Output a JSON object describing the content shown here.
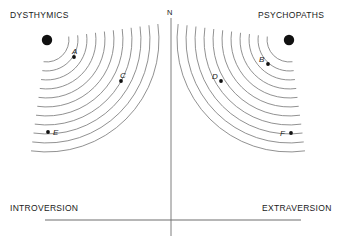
{
  "figure": {
    "title_n_axis": "N",
    "quadrants": {
      "top_left": "DYSTHYMICS",
      "top_right": "PSYCHOPATHS"
    },
    "axes": {
      "left": "INTROVERSION",
      "right": "EXTRAVERSION",
      "vertical": "N"
    },
    "colors": {
      "ink": "#1a1a1a",
      "arc": "#7d7d7d",
      "axis": "#6f6f6f",
      "point": "#111111"
    }
  },
  "chart_data": {
    "type": "scatter",
    "title": "",
    "subtitle": "",
    "xlabel": "",
    "ylabel": "",
    "axis_endpoints": {
      "left_label": "INTROVERSION",
      "right_label": "EXTRAVERSION",
      "vertical_label": "N"
    },
    "grid": false,
    "legend_position": "none",
    "panels": [
      {
        "name": "DYSTHYMICS",
        "origin_label": "dysthymic-pole",
        "origin": {
          "x": 47,
          "y": 40,
          "r": 5.2
        },
        "arc_count": 11,
        "arc_radii": [
          22,
          31,
          40,
          49,
          58,
          67,
          76,
          85,
          94,
          103,
          112
        ],
        "arc_start_deg": -8,
        "arc_end_deg": 98,
        "points": [
          {
            "id": "A",
            "x": 74,
            "y": 57,
            "label_dx": -2,
            "label_dy": -10
          },
          {
            "id": "C",
            "x": 121,
            "y": 81,
            "label_dx": -1,
            "label_dy": -10
          },
          {
            "id": "E",
            "x": 48,
            "y": 132,
            "label_dx": 5,
            "label_dy": -4
          }
        ]
      },
      {
        "name": "PSYCHOPATHS",
        "origin_label": "psychopath-pole",
        "origin": {
          "x": 289,
          "y": 40,
          "r": 5.2
        },
        "arc_count": 11,
        "arc_radii": [
          22,
          31,
          40,
          49,
          58,
          67,
          76,
          85,
          94,
          103,
          112
        ],
        "arc_start_deg": 82,
        "arc_end_deg": 188,
        "points": [
          {
            "id": "B",
            "x": 268,
            "y": 64,
            "label_dx": -9,
            "label_dy": -9
          },
          {
            "id": "D",
            "x": 221,
            "y": 81,
            "label_dx": -9,
            "label_dy": -9
          },
          {
            "id": "F",
            "x": 291,
            "y": 133,
            "label_dx": -11,
            "label_dy": -4
          }
        ]
      }
    ],
    "lines": [
      {
        "name": "vertical-axis",
        "x1": 171,
        "y1": 18,
        "x2": 171,
        "y2": 236
      },
      {
        "name": "horizontal-axis",
        "x1": 45,
        "y1": 220,
        "x2": 301,
        "y2": 220
      }
    ]
  }
}
